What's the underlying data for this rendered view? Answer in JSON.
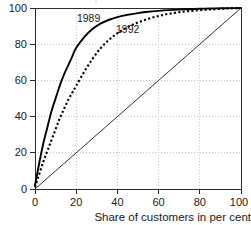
{
  "chart_data": {
    "type": "line",
    "title": "",
    "subtitle": "",
    "xlabel": "Share of customers in per cent",
    "ylabel": "",
    "xlim": [
      0,
      100
    ],
    "ylim": [
      0,
      100
    ],
    "xticks": [
      0,
      20,
      40,
      60,
      80,
      100
    ],
    "yticks": [
      0,
      20,
      40,
      60,
      80,
      100
    ],
    "xtick_labels": [
      "0",
      "20",
      "40",
      "60",
      "80",
      "100"
    ],
    "ytick_labels": [
      "0",
      "20",
      "40",
      "60",
      "80",
      "100"
    ],
    "grid": true,
    "grid_style": "dotted",
    "legend": "inline-annotations",
    "legend_position": "on-plot",
    "series": [
      {
        "name": "1989",
        "style": "solid",
        "color": "#000000",
        "annotation": {
          "text": "1989",
          "x": 26,
          "y": 92
        },
        "x": [
          0,
          2,
          4,
          6,
          8,
          10,
          12,
          14,
          16,
          18,
          20,
          24,
          28,
          32,
          36,
          40,
          45,
          50,
          55,
          60,
          65,
          70,
          75,
          80,
          85,
          90,
          95,
          100
        ],
        "y": [
          2,
          14,
          25,
          34,
          43,
          50,
          57,
          63,
          68,
          73,
          78,
          84,
          88.5,
          91.5,
          93.5,
          95,
          96.3,
          97.2,
          97.9,
          98.4,
          98.8,
          99.1,
          99.35,
          99.55,
          99.7,
          99.83,
          99.93,
          100
        ]
      },
      {
        "name": "1992",
        "style": "dotted",
        "color": "#000000",
        "annotation": {
          "text": "1992",
          "x": 45,
          "y": 86
        },
        "x": [
          0,
          2,
          4,
          6,
          8,
          10,
          12,
          14,
          16,
          18,
          20,
          24,
          28,
          32,
          36,
          40,
          45,
          50,
          55,
          60,
          65,
          70,
          75,
          80,
          85,
          90,
          95,
          100
        ],
        "y": [
          1,
          8,
          15,
          21,
          27,
          33,
          39,
          44,
          49,
          53,
          57,
          65,
          72,
          78,
          82.5,
          86,
          89.5,
          92,
          94,
          95.6,
          96.8,
          97.7,
          98.3,
          98.8,
          99.2,
          99.5,
          99.8,
          100
        ]
      },
      {
        "name": "equality-line",
        "style": "thin-solid",
        "color": "#333333",
        "annotation": null,
        "x": [
          0,
          100
        ],
        "y": [
          0,
          100
        ]
      }
    ]
  },
  "axis": {
    "x_title": "Share of customers in per cent",
    "y_tick_0": "0",
    "y_tick_20": "20",
    "y_tick_40": "40",
    "y_tick_60": "60",
    "y_tick_80": "80",
    "y_tick_100": "100",
    "x_tick_0": "0",
    "x_tick_20": "20",
    "x_tick_40": "40",
    "x_tick_60": "60",
    "x_tick_80": "80",
    "x_tick_100": "100"
  },
  "annotations": {
    "series_1989": "1989",
    "series_1992": "1992"
  },
  "colors": {
    "curve": "#000000",
    "axis": "#2b2b2b",
    "grid": "#bdbdbd",
    "background": "#ffffff",
    "text": "#1a1a1a"
  }
}
